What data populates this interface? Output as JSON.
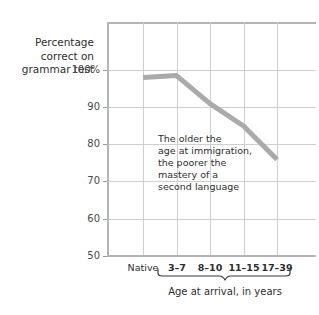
{
  "chart_data": {
    "type": "line",
    "title": "",
    "ylabel": "Percentage correct on grammar test",
    "xlabel": "Age at arrival, in years",
    "categories": [
      "Native",
      "3–7",
      "8–10",
      "11–15",
      "17–39"
    ],
    "values": [
      98,
      98.5,
      91,
      85,
      76
    ],
    "series": [
      {
        "name": "Percentage correct on grammar test",
        "values": [
          98,
          98.5,
          91,
          85,
          76
        ]
      }
    ],
    "ylim": [
      50,
      105
    ],
    "yticks": [
      50,
      60,
      70,
      80,
      90,
      100
    ],
    "ytick_labels": [
      "50",
      "60",
      "70",
      "80",
      "90",
      "100%"
    ],
    "grid": true,
    "legend": false,
    "line_color": "#aaaaaa",
    "grid_color": "#cfcfcf",
    "axis_color": "#b4b4b4",
    "annotations": [
      {
        "lines": [
          "The older the",
          "age at immigration,",
          "the poorer the",
          "mastery of a",
          "second language"
        ]
      }
    ],
    "brace_covers": [
      "3–7",
      "8–10",
      "11–15",
      "17–39"
    ]
  },
  "y_axis": {
    "title_lines": [
      "Percentage",
      "correct on",
      "grammar test"
    ],
    "ticks": [
      {
        "label": "100%",
        "value": 100
      },
      {
        "label": "90",
        "value": 90
      },
      {
        "label": "80",
        "value": 80
      },
      {
        "label": "70",
        "value": 70
      },
      {
        "label": "60",
        "value": 60
      },
      {
        "label": "50",
        "value": 50
      }
    ]
  },
  "x_axis": {
    "caption": "Age at arrival, in years",
    "ticks": [
      {
        "label": "Native",
        "bold": false
      },
      {
        "label": "3–7",
        "bold": true
      },
      {
        "label": "8–10",
        "bold": true
      },
      {
        "label": "11–15",
        "bold": true
      },
      {
        "label": "17–39",
        "bold": true
      }
    ]
  },
  "annotation": {
    "lines": [
      "The older the",
      "age at immigration,",
      "the poorer the",
      "mastery of a",
      "second language"
    ]
  }
}
